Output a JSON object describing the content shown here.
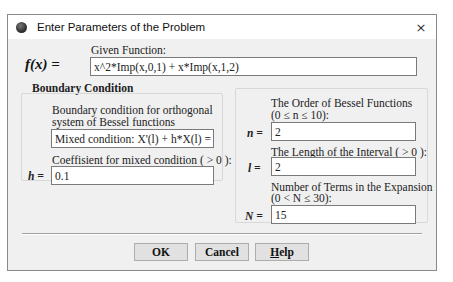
{
  "window": {
    "title": "Enter Parameters of the Problem",
    "app_icon": "app-icon",
    "close_icon": "×"
  },
  "function": {
    "symbol": "f(x) =",
    "label": "Given Function:",
    "value": "x^2*Imp(x,0,1) + x*Imp(x,1,2)"
  },
  "boundary": {
    "group_title": "Boundary Condition",
    "condition_label_line1": "Boundary condition for orthogonal",
    "condition_label_line2": "system of Bessel functions",
    "condition_selected": "Mixed condition:  X'(l) + h*X(l) = 0",
    "dropdown_icon": "⌄",
    "coef_label": "Coeffisient for mixed condition ( > 0 ):",
    "coef_symbol": "h =",
    "coef_value": "0.1"
  },
  "params": {
    "order_label_line1": "The Order of Bessel Functions",
    "order_label_line2": "(0 ≤ n ≤ 10):",
    "order_symbol": "n =",
    "order_value": "2",
    "length_label": "The Length of the Interval  ( > 0 ):",
    "length_symbol": "l =",
    "length_value": "2",
    "terms_label_line1": "Number of Terms in the Expansion",
    "terms_label_line2": "(0 < N ≤ 30):",
    "terms_symbol": "N =",
    "terms_value": "15"
  },
  "buttons": {
    "ok": "OK",
    "cancel": "Cancel",
    "help_first": "H",
    "help_rest": "elp"
  }
}
